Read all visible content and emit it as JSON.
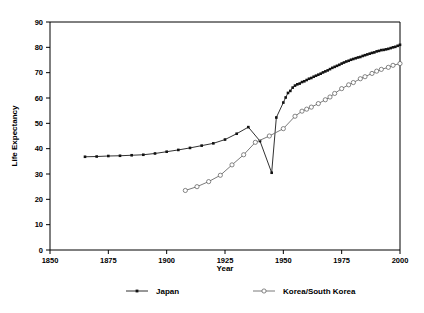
{
  "chart_data": {
    "type": "line",
    "title": "",
    "subtitle": "",
    "xlabel": "Year",
    "ylabel": "Life Expectancy",
    "xlim": [
      1850,
      2000
    ],
    "ylim": [
      0,
      90
    ],
    "xticks": [
      1850,
      1875,
      1900,
      1925,
      1950,
      1975,
      2000
    ],
    "xtick_labels": [
      "1850",
      "1875",
      "1900",
      "1925",
      "1950",
      "1975",
      "2000"
    ],
    "yticks": [
      0,
      10,
      20,
      30,
      40,
      50,
      60,
      70,
      80,
      90
    ],
    "ytick_labels": [
      "0",
      "10",
      "20",
      "30",
      "40",
      "50",
      "60",
      "70",
      "80",
      "90"
    ],
    "grid": false,
    "legend_position": "bottom",
    "annotations": [],
    "series": [
      {
        "name": "Japan",
        "marker": "filled-square",
        "color": "#1a1a1a",
        "x": [
          1865,
          1870,
          1875,
          1880,
          1885,
          1890,
          1895,
          1900,
          1905,
          1910,
          1915,
          1920,
          1925,
          1930,
          1935,
          1940,
          1945,
          1947,
          1950,
          1951,
          1952,
          1953,
          1954,
          1955,
          1956,
          1957,
          1958,
          1959,
          1960,
          1961,
          1962,
          1963,
          1964,
          1965,
          1966,
          1967,
          1968,
          1969,
          1970,
          1971,
          1972,
          1973,
          1974,
          1975,
          1976,
          1977,
          1978,
          1979,
          1980,
          1981,
          1982,
          1983,
          1984,
          1985,
          1986,
          1987,
          1988,
          1989,
          1990,
          1991,
          1992,
          1993,
          1994,
          1995,
          1996,
          1997,
          1998,
          1999,
          2000
        ],
        "y": [
          36.8,
          36.9,
          37.1,
          37.2,
          37.4,
          37.6,
          38.1,
          38.8,
          39.5,
          40.3,
          41.2,
          42.1,
          43.6,
          45.9,
          48.5,
          43.0,
          30.5,
          52.3,
          58.2,
          60.2,
          62.0,
          62.8,
          64.1,
          64.9,
          65.4,
          65.7,
          66.3,
          66.6,
          67.1,
          67.6,
          67.9,
          68.4,
          68.8,
          69.2,
          69.6,
          70.1,
          70.5,
          70.9,
          71.4,
          71.9,
          72.3,
          72.7,
          73.1,
          73.6,
          74.0,
          74.4,
          74.7,
          75.1,
          75.4,
          75.7,
          76.0,
          76.2,
          76.6,
          76.9,
          77.2,
          77.5,
          77.8,
          78.0,
          78.4,
          78.6,
          78.9,
          79.0,
          79.2,
          79.4,
          79.7,
          80.0,
          80.2,
          80.6,
          81.0
        ]
      },
      {
        "name": "Korea/South Korea",
        "marker": "open-circle",
        "color": "#6b6b6b",
        "x": [
          1908,
          1913,
          1918,
          1923,
          1928,
          1933,
          1938,
          1944,
          1950,
          1955,
          1958,
          1960,
          1962,
          1965,
          1968,
          1970,
          1972,
          1975,
          1978,
          1980,
          1983,
          1985,
          1988,
          1990,
          1992,
          1995,
          1997,
          2000
        ],
        "y": [
          23.5,
          25.0,
          27.0,
          29.5,
          33.6,
          37.6,
          42.5,
          45.0,
          47.9,
          52.8,
          54.8,
          55.6,
          56.4,
          57.8,
          59.3,
          60.4,
          61.8,
          63.7,
          65.2,
          66.1,
          67.6,
          68.4,
          69.7,
          70.6,
          71.3,
          72.1,
          72.9,
          73.6
        ]
      }
    ]
  },
  "legend": {
    "entries": [
      {
        "label": "Japan",
        "marker": "filled-square",
        "color": "#1a1a1a"
      },
      {
        "label": "Korea/South Korea",
        "marker": "open-circle",
        "color": "#6b6b6b"
      }
    ]
  }
}
